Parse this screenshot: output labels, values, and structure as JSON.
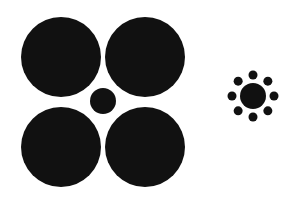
{
  "figure": {
    "title": "",
    "background": "#ffffff",
    "fill": "#111111",
    "left_group": {
      "center_circle": {
        "cx": 103,
        "cy": 101,
        "r": 13
      },
      "surrounding_circles": [
        {
          "cx": 61,
          "cy": 57,
          "r": 40
        },
        {
          "cx": 145,
          "cy": 57,
          "r": 40
        },
        {
          "cx": 61,
          "cy": 147,
          "r": 40
        },
        {
          "cx": 145,
          "cy": 147,
          "r": 40
        }
      ]
    },
    "right_group": {
      "center_circle": {
        "cx": 253,
        "cy": 96,
        "r": 13
      },
      "ring_radius": 21,
      "dot_count": 8,
      "dot_r": 4.5
    }
  }
}
